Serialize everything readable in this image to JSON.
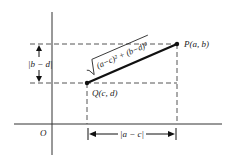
{
  "diagram": {
    "origin_label": "O",
    "point_p": {
      "label": "P(a, b)"
    },
    "point_q": {
      "label": "Q(c, d)"
    },
    "vertical_distance_label": "|b − d|",
    "horizontal_distance_label": "|a − c|",
    "distance_formula": "√((a−c)² + (b−d)²)",
    "formula_inner": "(a−c)² + (b−d)²",
    "colors": {
      "ink": "#222222",
      "dash": "#555555",
      "background": "#ffffff"
    }
  }
}
